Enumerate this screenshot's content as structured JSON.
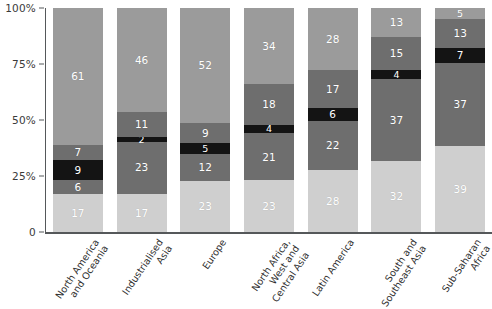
{
  "chart_data": {
    "type": "bar",
    "subtype": "stacked-bar-100",
    "title": "",
    "xlabel": "",
    "ylabel": "",
    "ylim": [
      0,
      100
    ],
    "grid": false,
    "legend": "none",
    "categories": [
      "North America and Oceania",
      "Industrialised Asia",
      "Europe",
      "North Africa, West and Central Asia",
      "Latin America",
      "South and Southeast Asia",
      "Sub-Saharan Africa"
    ],
    "category_lines": [
      [
        "North America",
        "and Oceania"
      ],
      [
        "Industrialised",
        "Asia"
      ],
      [
        "Europe"
      ],
      [
        "North Africa,",
        "West and",
        "Central Asia"
      ],
      [
        "Latin America"
      ],
      [
        "South and",
        "Southeast Asia"
      ],
      [
        "Sub-Saharan",
        "Africa"
      ]
    ],
    "ytick_labels": [
      "0",
      "25%",
      "50%",
      "75%",
      "100%"
    ],
    "ytick_values": [
      0,
      25,
      50,
      75,
      100
    ],
    "series": [
      {
        "name": "segment-1-bottom",
        "color": "#cfcfcf",
        "values": [
          17,
          17,
          23,
          23,
          28,
          32,
          39
        ]
      },
      {
        "name": "segment-2",
        "color": "#6e6e6e",
        "values": [
          6,
          23,
          12,
          21,
          22,
          37,
          37
        ]
      },
      {
        "name": "segment-3-black",
        "color": "#141414",
        "values": [
          9,
          2,
          5,
          4,
          6,
          4,
          7
        ]
      },
      {
        "name": "segment-4",
        "color": "#6e6e6e",
        "values": [
          7,
          11,
          9,
          18,
          17,
          15,
          13
        ]
      },
      {
        "name": "segment-5-top",
        "color": "#9b9b9b",
        "values": [
          61,
          46,
          52,
          34,
          28,
          13,
          5
        ]
      }
    ]
  },
  "colors": {
    "bottom_light_gray": "#cfcfcf",
    "mid_dark_gray": "#6e6e6e",
    "black": "#141414",
    "upper_dark_gray": "#6e6e6e",
    "top_gray": "#9b9b9b",
    "axis": "#55585a",
    "tick_text": "#3a3a3a",
    "label_text": "#2f2f2f",
    "value_text": "#ffffff",
    "background": "#ffffff"
  }
}
